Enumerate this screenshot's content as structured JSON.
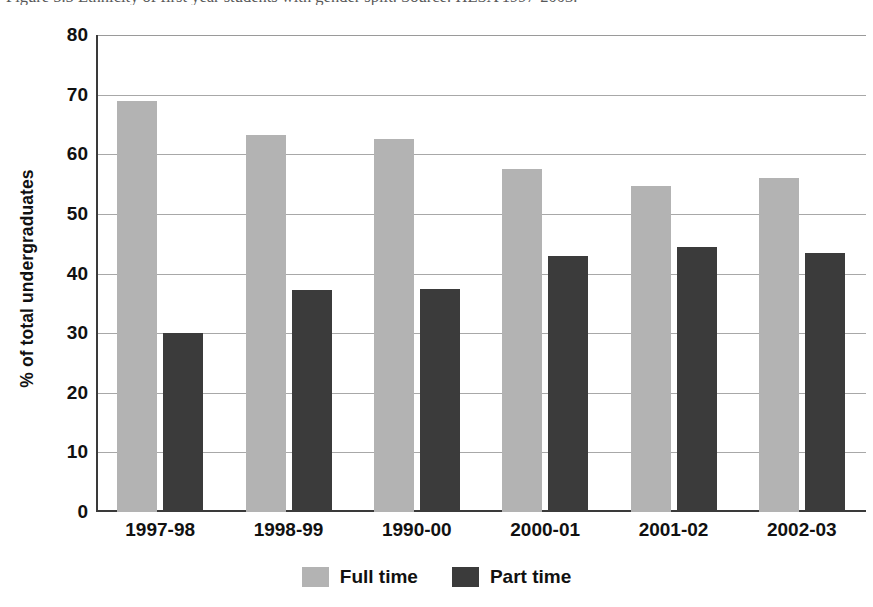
{
  "caption": "Figure 5.5 Ethnicity of first year students with gender split. Source: HESA 1997-2003.",
  "chart_data": {
    "type": "bar",
    "title": "",
    "subtitle": "",
    "xlabel": "",
    "ylabel": "% of total undergraduates",
    "ylim": [
      0,
      80
    ],
    "ytick_step": 10,
    "yticks": [
      "80",
      "70",
      "60",
      "50",
      "40",
      "30",
      "20",
      "10",
      "0"
    ],
    "grid": true,
    "legend_position": "bottom-center",
    "categories": [
      "1997-98",
      "1998-99",
      "1990-00",
      "2000-01",
      "2001-02",
      "2002-03"
    ],
    "series": [
      {
        "name": "Full time",
        "color": "#b3b3b3",
        "values": [
          68.9,
          63.3,
          62.6,
          57.5,
          54.7,
          56.1
        ]
      },
      {
        "name": "Part time",
        "color": "#3b3b3b",
        "values": [
          30.0,
          37.2,
          37.4,
          42.9,
          44.4,
          43.5
        ]
      }
    ]
  },
  "legend": {
    "items": [
      {
        "label": "Full time",
        "color": "#b3b3b3"
      },
      {
        "label": "Part time",
        "color": "#3b3b3b"
      }
    ]
  }
}
